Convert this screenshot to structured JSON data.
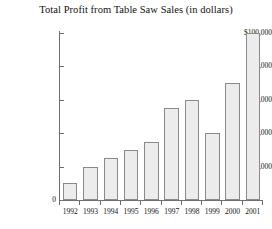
{
  "chart_data": {
    "type": "bar",
    "title": "Total Profit from Table Saw Sales (in dollars)",
    "xlabel": "",
    "ylabel": "",
    "categories": [
      "1992",
      "1993",
      "1994",
      "1995",
      "1996",
      "1997",
      "1998",
      "1999",
      "2000",
      "2001"
    ],
    "values": [
      10000,
      20000,
      25000,
      30000,
      35000,
      55000,
      60000,
      40000,
      70000,
      100000
    ],
    "ylim": [
      0,
      100000
    ],
    "ytick_values": [
      0,
      20000,
      40000,
      60000,
      80000,
      100000
    ],
    "ytick_labels": [
      "0",
      "$20,000",
      "$40,000",
      "$60,000",
      "$80,000",
      "$100,000"
    ],
    "grid": false,
    "legend": null,
    "bar_fill_color": "#ececec",
    "bar_edge_color": "#8a8a8a",
    "axis_color": "#6e6e6e",
    "background_color": "#ffffff",
    "text_color": "#111111"
  }
}
